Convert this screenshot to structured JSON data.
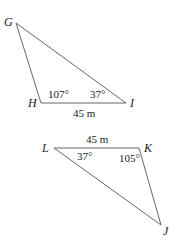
{
  "diagram": {
    "triangles": [
      {
        "name": "GHI",
        "vertices": [
          {
            "label": "G",
            "x": 16,
            "y": 23,
            "lx": 4,
            "ly": 26
          },
          {
            "label": "H",
            "x": 41,
            "y": 103,
            "lx": 28,
            "ly": 107
          },
          {
            "label": "I",
            "x": 126,
            "y": 103,
            "lx": 130,
            "ly": 107
          }
        ],
        "side": {
          "label": "45 m",
          "x": 73,
          "y": 117
        },
        "angles": [
          {
            "label": "107°",
            "x": 48,
            "y": 98
          },
          {
            "label": "37°",
            "x": 90,
            "y": 98
          }
        ]
      },
      {
        "name": "JKL",
        "vertices": [
          {
            "label": "L",
            "x": 54,
            "y": 148,
            "lx": 42,
            "ly": 152
          },
          {
            "label": "K",
            "x": 139,
            "y": 148,
            "lx": 144,
            "ly": 152
          },
          {
            "label": "J",
            "x": 161,
            "y": 225,
            "lx": 163,
            "ly": 235
          }
        ],
        "side": {
          "label": "45 m",
          "x": 86,
          "y": 143
        },
        "angles": [
          {
            "label": "37°",
            "x": 77,
            "y": 160
          },
          {
            "label": "105°",
            "x": 119,
            "y": 162
          }
        ]
      }
    ]
  }
}
